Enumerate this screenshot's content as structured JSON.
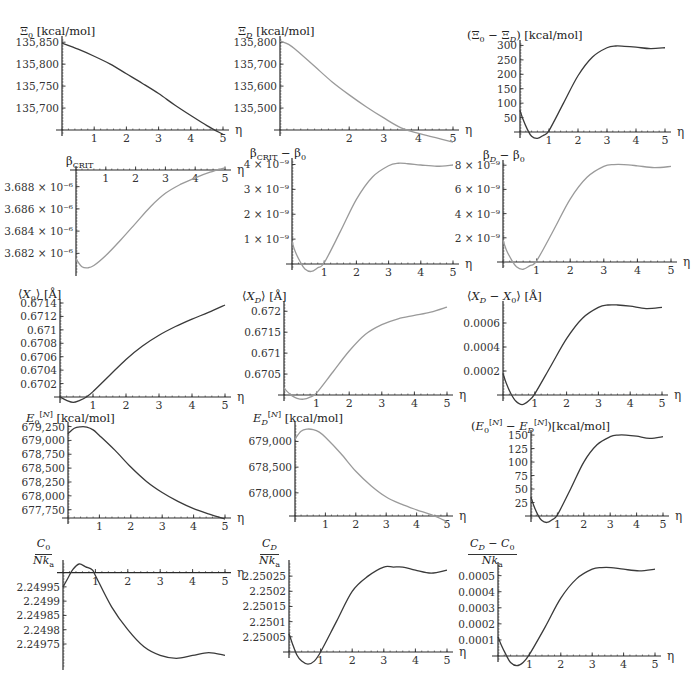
{
  "figure": {
    "x_axis_symbol": "η",
    "curve_color_dark": "#3a3a3a",
    "curve_color_light": "#9a9a9a",
    "axis_color": "#2a2a2a"
  },
  "chart_data": [
    {
      "id": "xi0",
      "type": "line",
      "title": "Ξ0 [kcal/mol]",
      "title_html": "Ξ<sub>0</sub> [kcal/mol]",
      "box": {
        "left": 10,
        "top": 18,
        "width": 225,
        "height": 120
      },
      "plot": {
        "x0": 52,
        "x1": 213,
        "y_axis_top": 22,
        "y_axis_bottom": 112
      },
      "xlabel": "η",
      "xlim": [
        0,
        5
      ],
      "ylim": [
        135650,
        135855
      ],
      "x_axis_at": 135650,
      "x_ticks": [
        1,
        2,
        3,
        4,
        5
      ],
      "y_ticks": [
        135700,
        135750,
        135800,
        135850
      ],
      "y_tick_labels": [
        "135,700",
        "135,750",
        "135,800",
        "135,850"
      ],
      "color": "dark",
      "x": [
        0,
        0.5,
        1,
        1.5,
        2,
        2.5,
        3,
        3.5,
        4,
        4.5,
        5
      ],
      "y": [
        135848,
        135834,
        135818,
        135800,
        135778,
        135756,
        135733,
        135707,
        135683,
        135660,
        135640
      ]
    },
    {
      "id": "xiD",
      "type": "line",
      "title": "ΞD [kcal/mol]",
      "title_html": "Ξ<sub><i>D</i></sub> [kcal/mol]",
      "box": {
        "left": 240,
        "top": 18,
        "width": 225,
        "height": 120
      },
      "plot": {
        "x0": 40,
        "x1": 213,
        "y_axis_top": 22,
        "y_axis_bottom": 112
      },
      "xlabel": "η",
      "xlim": [
        0,
        5
      ],
      "ylim": [
        135400,
        135810
      ],
      "x_axis_at": 135400,
      "x_ticks": [
        2,
        3,
        4,
        5
      ],
      "y_ticks": [
        135500,
        135600,
        135700,
        135800
      ],
      "y_tick_labels": [
        "135,500",
        "135,600",
        "135,700",
        "135,800"
      ],
      "color": "light",
      "x": [
        0,
        0.25,
        0.5,
        1,
        1.5,
        2,
        2.5,
        3,
        3.5,
        4,
        4.5,
        5
      ],
      "y": [
        135805,
        135790,
        135760,
        135690,
        135620,
        135560,
        135505,
        135455,
        135410,
        135385,
        135365,
        135345
      ]
    },
    {
      "id": "xi_diff",
      "type": "line",
      "title": "(Ξ0 − ΞD) [kcal/mol]",
      "title_html": "(Ξ<sub>0</sub> − Ξ<sub><i>D</i></sub>) [kcal/mol]",
      "box": {
        "left": 465,
        "top": 18,
        "width": 230,
        "height": 120
      },
      "plot": {
        "x0": 55,
        "x1": 200,
        "y_axis_top": 26,
        "y_axis_bottom": 114
      },
      "xlabel": "η",
      "xlim": [
        0,
        5
      ],
      "ylim": [
        0,
        305
      ],
      "x_axis_at": 0,
      "x_ticks": [
        1,
        2,
        3,
        4,
        5
      ],
      "y_ticks": [
        50,
        100,
        150,
        200,
        250,
        300
      ],
      "y_tick_labels": [
        "50",
        "100",
        "150",
        "200",
        "250",
        "300"
      ],
      "color": "dark",
      "x": [
        0,
        0.1,
        0.25,
        0.4,
        0.6,
        0.8,
        1,
        1.5,
        2,
        2.5,
        3,
        3.3,
        3.6,
        4,
        4.5,
        5
      ],
      "y": [
        75,
        45,
        10,
        -15,
        -22,
        -12,
        5,
        100,
        195,
        260,
        292,
        298,
        297,
        294,
        289,
        292
      ]
    },
    {
      "id": "beta_crit",
      "type": "line",
      "title": "βCRIT",
      "title_html": "β<sub>CRIT</sub>",
      "box": {
        "left": 10,
        "top": 152,
        "width": 225,
        "height": 125
      },
      "plot": {
        "x0": 66,
        "x1": 215,
        "y_axis_top": 18,
        "y_axis_bottom": 118
      },
      "xlabel": "η",
      "xlim": [
        0,
        5
      ],
      "ylim": [
        3.6805e-06,
        3.6895e-06
      ],
      "x_axis_at": 3.6895e-06,
      "x_axis_top": true,
      "x_ticks": [
        1,
        2,
        3,
        4,
        5
      ],
      "y_ticks": [
        3.682e-06,
        3.684e-06,
        3.686e-06,
        3.688e-06
      ],
      "y_tick_labels": [
        "3.682 × 10⁻⁶",
        "3.684 × 10⁻⁶",
        "3.686 × 10⁻⁶",
        "3.688 × 10⁻⁶"
      ],
      "color": "light",
      "x": [
        0,
        0.2,
        0.4,
        0.6,
        1,
        1.5,
        2,
        2.5,
        3,
        3.5,
        4,
        4.5,
        5
      ],
      "y": [
        3.6815e-06,
        3.6808e-06,
        3.6807e-06,
        3.6809e-06,
        3.6818e-06,
        3.6832e-06,
        3.6847e-06,
        3.6862e-06,
        3.6874e-06,
        3.6882e-06,
        3.6888e-06,
        3.6893e-06,
        3.6897e-06
      ]
    },
    {
      "id": "beta_crit_minus_beta0",
      "type": "line",
      "title": "βCRIT − β0",
      "title_html": "β<sub>CRIT</sub> − β<sub>0</sub>",
      "box": {
        "left": 240,
        "top": 152,
        "width": 225,
        "height": 125
      },
      "plot": {
        "x0": 52,
        "x1": 213,
        "y_axis_top": 10,
        "y_axis_bottom": 112
      },
      "xlabel": "η",
      "xlim": [
        0,
        5
      ],
      "ylim": [
        0,
        4.1e-09
      ],
      "x_axis_at": 0,
      "x_ticks": [
        1,
        2,
        3,
        4,
        5
      ],
      "y_ticks": [
        1e-09,
        2e-09,
        3e-09,
        4e-09
      ],
      "y_tick_labels": [
        "1 × 10⁻⁹",
        "2 × 10⁻⁹",
        "3 × 10⁻⁹",
        "4 × 10⁻⁹"
      ],
      "color": "light",
      "x": [
        0,
        0.1,
        0.25,
        0.4,
        0.6,
        0.8,
        1,
        1.5,
        2,
        2.5,
        3,
        3.3,
        3.6,
        4,
        4.5,
        5
      ],
      "y": [
        9e-10,
        5e-10,
        1e-10,
        -2e-10,
        -3e-10,
        -1.5e-10,
        5e-11,
        1.3e-09,
        2.6e-09,
        3.5e-09,
        3.95e-09,
        4.05e-09,
        4.03e-09,
        3.98e-09,
        3.93e-09,
        3.98e-09
      ]
    },
    {
      "id": "betaD_minus_beta0",
      "type": "line",
      "title": "βD − β0",
      "title_html": "β<sub><i>D</i></sub> − β<sub>0</sub>",
      "box": {
        "left": 465,
        "top": 152,
        "width": 230,
        "height": 125
      },
      "plot": {
        "x0": 38,
        "x1": 206,
        "y_axis_top": 12,
        "y_axis_bottom": 110
      },
      "xlabel": "η",
      "xlim": [
        0,
        5
      ],
      "ylim": [
        0,
        8.1e-09
      ],
      "x_axis_at": 0,
      "x_ticks": [
        1,
        2,
        3,
        4,
        5
      ],
      "y_ticks": [
        2e-09,
        4e-09,
        6e-09,
        8e-09
      ],
      "y_tick_labels": [
        "2 × 10⁻⁹",
        "4 × 10⁻⁹",
        "6 × 10⁻⁹",
        "8 × 10⁻⁹"
      ],
      "color": "light",
      "x": [
        0,
        0.1,
        0.25,
        0.4,
        0.6,
        0.8,
        1,
        1.5,
        2,
        2.5,
        3,
        3.3,
        3.6,
        4,
        4.5,
        5
      ],
      "y": [
        1.8e-09,
        1e-09,
        2e-10,
        -4e-10,
        -6e-10,
        -3e-10,
        1e-10,
        2.6e-09,
        5.2e-09,
        7e-09,
        7.9e-09,
        8.05e-09,
        8.05e-09,
        7.95e-09,
        7.8e-09,
        7.9e-09
      ]
    },
    {
      "id": "x0",
      "type": "line",
      "title": "⟨X0⟩ [Å]",
      "title_html": "⟨<i>X</i><sub>0</sub>⟩ [Å]",
      "box": {
        "left": 10,
        "top": 285,
        "width": 225,
        "height": 122
      },
      "plot": {
        "x0": 50,
        "x1": 215,
        "y_axis_top": 18,
        "y_axis_bottom": 112
      },
      "xlabel": "η",
      "xlim": [
        0,
        5
      ],
      "ylim": [
        0.67,
        0.6714
      ],
      "x_axis_at": 0.67,
      "x_ticks": [
        1,
        2,
        3,
        4,
        5
      ],
      "y_ticks": [
        0.6702,
        0.6704,
        0.6706,
        0.6708,
        0.671,
        0.6712,
        0.6714
      ],
      "y_tick_labels": [
        "0.6702",
        "0.6704",
        "0.6706",
        "0.6708",
        "0.671",
        "0.6712",
        "0.6714"
      ],
      "color": "dark",
      "x": [
        0,
        0.2,
        0.4,
        0.6,
        0.8,
        1,
        1.5,
        2,
        2.5,
        3,
        3.5,
        4,
        4.5,
        5
      ],
      "y": [
        0.67,
        0.66995,
        0.66992,
        0.66995,
        0.67,
        0.67008,
        0.67032,
        0.67056,
        0.67076,
        0.67092,
        0.67105,
        0.67116,
        0.67126,
        0.67137
      ]
    },
    {
      "id": "xD",
      "type": "line",
      "title": "⟨XD⟩ [Å]",
      "title_html": "⟨<i>X<sub>D</sub></i>⟩ [Å]",
      "box": {
        "left": 240,
        "top": 285,
        "width": 225,
        "height": 122
      },
      "plot": {
        "x0": 44,
        "x1": 207,
        "y_axis_top": 20,
        "y_axis_bottom": 110
      },
      "xlabel": "η",
      "xlim": [
        0,
        5
      ],
      "ylim": [
        0.67,
        0.67215
      ],
      "x_axis_at": 0.67,
      "x_ticks": [
        1,
        2,
        3,
        4,
        5
      ],
      "y_ticks": [
        0.6705,
        0.671,
        0.6715,
        0.672
      ],
      "y_tick_labels": [
        "0.6705",
        "0.671",
        "0.6715",
        "0.672"
      ],
      "color": "light",
      "x": [
        0,
        0.1,
        0.25,
        0.4,
        0.6,
        0.8,
        1,
        1.5,
        2,
        2.5,
        3,
        3.5,
        4,
        4.5,
        5
      ],
      "y": [
        0.67017,
        0.67008,
        0.66998,
        0.66992,
        0.6699,
        0.66995,
        0.67005,
        0.67055,
        0.67105,
        0.67145,
        0.67168,
        0.67182,
        0.6719,
        0.67198,
        0.6721
      ]
    },
    {
      "id": "xD_minus_x0",
      "type": "line",
      "title": "⟨XD − X0⟩ [Å]",
      "title_html": "⟨<i>X<sub>D</sub></i> − <i>X</i><sub>0</sub>⟩ [Å]",
      "box": {
        "left": 465,
        "top": 285,
        "width": 230,
        "height": 122
      },
      "plot": {
        "x0": 38,
        "x1": 197,
        "y_axis_top": 20,
        "y_axis_bottom": 110
      },
      "xlabel": "η",
      "xlim": [
        0,
        5
      ],
      "ylim": [
        0,
        0.00075
      ],
      "x_axis_at": 0,
      "x_ticks": [
        1,
        2,
        3,
        4,
        5
      ],
      "y_ticks": [
        0.0002,
        0.0004,
        0.0006
      ],
      "y_tick_labels": [
        "0.0002",
        "0.0004",
        "0.0006"
      ],
      "color": "dark",
      "x": [
        0,
        0.1,
        0.25,
        0.4,
        0.6,
        0.8,
        1,
        1.5,
        2,
        2.5,
        3,
        3.3,
        3.6,
        4,
        4.5,
        5
      ],
      "y": [
        0.00018,
        0.0001,
        1e-05,
        -5e-05,
        -8e-05,
        -5e-05,
        1e-05,
        0.00024,
        0.00047,
        0.00064,
        0.00073,
        0.00075,
        0.00075,
        0.00074,
        0.00072,
        0.00073
      ]
    },
    {
      "id": "E0N",
      "type": "line",
      "title": "E0[N] [kcal/mol]",
      "title_html": "<i>E</i><sub>0</sub><sup>[<i>N</i>]</sup> [kcal/mol]",
      "box": {
        "left": 10,
        "top": 412,
        "width": 225,
        "height": 122
      },
      "plot": {
        "x0": 58,
        "x1": 215,
        "y_axis_top": 14,
        "y_axis_bottom": 106
      },
      "xlabel": "η",
      "xlim": [
        0,
        5
      ],
      "ylim": [
        677600,
        679260
      ],
      "x_axis_at": 677600,
      "x_ticks": [
        1,
        2,
        3,
        4,
        5
      ],
      "y_ticks": [
        677750,
        678000,
        678250,
        678500,
        678750,
        679000,
        679250
      ],
      "y_tick_labels": [
        "677,750",
        "678,000",
        "678,250",
        "678,500",
        "678,750",
        "679,000",
        "679,250"
      ],
      "color": "dark",
      "x": [
        0,
        0.2,
        0.4,
        0.6,
        0.8,
        1,
        1.5,
        2,
        2.5,
        3,
        3.5,
        4,
        4.5,
        5
      ],
      "y": [
        679120,
        679220,
        679245,
        679240,
        679190,
        679090,
        678820,
        678520,
        678260,
        678060,
        677900,
        677770,
        677670,
        677580
      ]
    },
    {
      "id": "EDN",
      "type": "line",
      "title": "ED[N] [kcal/mol]",
      "title_html": "<i>E<sub>D</sub></i><sup>[<i>N</i>]</sup> [kcal/mol]",
      "box": {
        "left": 240,
        "top": 412,
        "width": 225,
        "height": 122
      },
      "plot": {
        "x0": 55,
        "x1": 207,
        "y_axis_top": 14,
        "y_axis_bottom": 104
      },
      "xlabel": "η",
      "xlim": [
        0,
        5
      ],
      "ylim": [
        677550,
        679300
      ],
      "x_axis_at": 677550,
      "x_ticks": [
        1,
        2,
        3,
        4,
        5
      ],
      "y_ticks": [
        678000,
        678500,
        679000
      ],
      "y_tick_labels": [
        "678,000",
        "678,500",
        "679,000"
      ],
      "color": "light",
      "x": [
        0,
        0.2,
        0.4,
        0.6,
        0.8,
        1,
        1.5,
        2,
        2.5,
        3,
        3.5,
        4,
        4.5,
        5
      ],
      "y": [
        679050,
        679200,
        679240,
        679230,
        679180,
        679080,
        678770,
        678420,
        678140,
        677920,
        677780,
        677670,
        677570,
        677440
      ]
    },
    {
      "id": "E_diff",
      "type": "line",
      "title": "(E0[N] − ED[N]) [kcal/mol]",
      "title_html": "(<i>E</i><sub>0</sub><sup>[<i>N</i>]</sup> − <i>E<sub>D</sub></i><sup>[<i>N</i>]</sup>)[kcal/mol]",
      "box": {
        "left": 465,
        "top": 412,
        "width": 230,
        "height": 122
      },
      "plot": {
        "x0": 66,
        "x1": 198,
        "y_axis_top": 22,
        "y_axis_bottom": 104
      },
      "xlabel": "η",
      "xlim": [
        0,
        5
      ],
      "ylim": [
        0,
        152
      ],
      "x_axis_at": 0,
      "x_ticks": [
        1,
        2,
        3,
        4,
        5
      ],
      "y_ticks": [
        25,
        50,
        75,
        100,
        125,
        150
      ],
      "y_tick_labels": [
        "25",
        "50",
        "75",
        "100",
        "125",
        "150"
      ],
      "color": "dark",
      "x": [
        0,
        0.1,
        0.25,
        0.4,
        0.6,
        0.8,
        1,
        1.5,
        2,
        2.5,
        3,
        3.3,
        3.6,
        4,
        4.5,
        5
      ],
      "y": [
        35,
        20,
        3,
        -8,
        -12,
        -7,
        2,
        50,
        100,
        132,
        147,
        150,
        150,
        148,
        144,
        147
      ]
    },
    {
      "id": "C0",
      "type": "line",
      "title": "C0 / Nka",
      "title_num_html": "<i>C</i><sub>0</sub>",
      "title_den_html": "<i>Nk</i><sub>a</sub>",
      "box": {
        "left": 10,
        "top": 538,
        "width": 225,
        "height": 140
      },
      "plot": {
        "x0": 53,
        "x1": 215,
        "y_axis_top": 26,
        "y_axis_bottom": 126
      },
      "xlabel": "η",
      "xlim": [
        0,
        5
      ],
      "ylim": [
        2.24968,
        2.25003
      ],
      "x_axis_at": 2.25,
      "x_axis_top": true,
      "x_ticks": [
        1,
        2,
        3,
        4,
        5
      ],
      "y_ticks": [
        2.24975,
        2.2498,
        2.24985,
        2.2499,
        2.24995
      ],
      "y_tick_labels": [
        "2.24975",
        "2.2498",
        "2.24985",
        "2.2499",
        "2.24995"
      ],
      "color": "dark",
      "x": [
        0,
        0.15,
        0.3,
        0.5,
        0.7,
        0.9,
        1,
        1.5,
        2,
        2.5,
        3,
        3.5,
        4,
        4.5,
        5
      ],
      "y": [
        2.24995,
        2.24998,
        2.25001,
        2.25003,
        2.25002,
        2.25001,
        2.24999,
        2.24988,
        2.2498,
        2.24974,
        2.24971,
        2.2497,
        2.24971,
        2.24972,
        2.24971
      ]
    },
    {
      "id": "CD",
      "type": "line",
      "title": "CD / Nka",
      "title_num_html": "<i>C<sub>D</sub></i>",
      "title_den_html": "<i>Nk</i><sub>a</sub>",
      "box": {
        "left": 240,
        "top": 538,
        "width": 225,
        "height": 140
      },
      "plot": {
        "x0": 49,
        "x1": 207,
        "y_axis_top": 26,
        "y_axis_bottom": 114
      },
      "xlabel": "η",
      "xlim": [
        0,
        5
      ],
      "ylim": [
        2.25,
        2.25029
      ],
      "x_axis_at": 2.25,
      "x_ticks": [
        1,
        2,
        3,
        4,
        5
      ],
      "y_ticks": [
        2.25005,
        2.2501,
        2.25015,
        2.2502,
        2.25025
      ],
      "y_tick_labels": [
        "2.25005",
        "2.2501",
        "2.25015",
        "2.2502",
        "2.25025"
      ],
      "color": "dark",
      "x": [
        0,
        0.1,
        0.25,
        0.4,
        0.6,
        0.8,
        1,
        1.5,
        2,
        2.5,
        3,
        3.3,
        3.6,
        4,
        4.5,
        5
      ],
      "y": [
        2.25006,
        2.25003,
        2.24999,
        2.24997,
        2.24996,
        2.24997,
        2.25,
        2.2501,
        2.2502,
        2.25025,
        2.25028,
        2.25028,
        2.25028,
        2.25027,
        2.25026,
        2.25027
      ]
    },
    {
      "id": "CD_minus_C0",
      "type": "line",
      "title": "(CD − C0) / Nka",
      "title_num_html": "<i>C<sub>D</sub></i> − <i>C</i><sub>0</sub>",
      "title_den_html": "<i>Nk</i><sub>a</sub>",
      "box": {
        "left": 465,
        "top": 538,
        "width": 230,
        "height": 140
      },
      "plot": {
        "x0": 33,
        "x1": 190,
        "y_axis_top": 28,
        "y_axis_bottom": 118
      },
      "xlabel": "η",
      "xlim": [
        0,
        5
      ],
      "ylim": [
        0,
        0.00056
      ],
      "x_axis_at": 0,
      "x_ticks": [
        1,
        2,
        3,
        4,
        5
      ],
      "y_ticks": [
        0.0001,
        0.0002,
        0.0003,
        0.0004,
        0.0005
      ],
      "y_tick_labels": [
        "0.0001",
        "0.0002",
        "0.0003",
        "0.0004",
        "0.0005"
      ],
      "color": "dark",
      "x": [
        0,
        0.1,
        0.25,
        0.4,
        0.6,
        0.8,
        1,
        1.5,
        2,
        2.5,
        3,
        3.3,
        3.6,
        4,
        4.5,
        5
      ],
      "y": [
        0.00012,
        7e-05,
        1e-05,
        -4e-05,
        -6e-05,
        -4e-05,
        1e-05,
        0.00018,
        0.00036,
        0.00048,
        0.00054,
        0.00055,
        0.00055,
        0.00054,
        0.00053,
        0.00054
      ]
    }
  ]
}
